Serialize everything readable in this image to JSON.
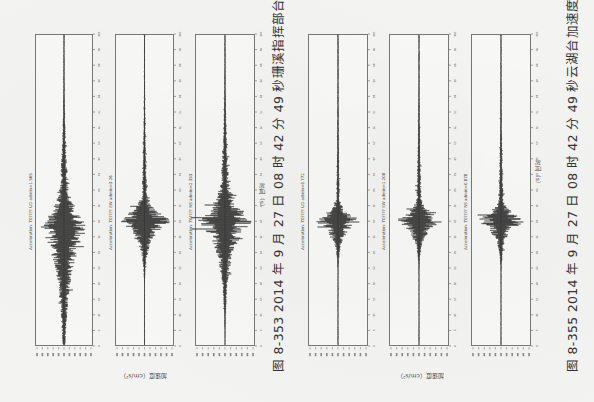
{
  "chart_data": [
    {
      "type": "line",
      "figure_number": "图 8-353",
      "title": "2014 年 9 月 27 日 08 时 42 分 49 秒珊溪指挥部台加速度记录",
      "orientation": "rotated 90° (time axis runs top-to-bottom along page)",
      "xlabel": "时间（s）",
      "ylabel": "加速度（cm/s²）",
      "grid": false,
      "series": [
        {
          "name": "Acceleration (UD component)",
          "panel_title": "Acceleration: T0???? UD admin=1.565",
          "peak_amplitude_label": "1.565",
          "envelope": {
            "onset": 0.45,
            "peak": 0.62,
            "decay": 0.78,
            "max": 0.9,
            "pre": 0.12,
            "spread": 0.14
          }
        },
        {
          "name": "Acceleration (EW component)",
          "panel_title": "Acceleration: T0???? EW admin=3.26",
          "peak_amplitude_label": "3.26",
          "envelope": {
            "onset": 0.5,
            "peak": 0.6,
            "decay": 0.72,
            "max": 1.0,
            "pre": 0.08,
            "spread": 0.05
          }
        },
        {
          "name": "Acceleration (NS component)",
          "panel_title": "Acceleration: T0???? NS admin=2.353",
          "peak_amplitude_label": "2.353",
          "envelope": {
            "onset": 0.45,
            "peak": 0.6,
            "decay": 0.76,
            "max": 1.0,
            "pre": 0.12,
            "spread": 0.09
          }
        }
      ],
      "time_ticks": [
        "0",
        "5",
        "10",
        "15",
        "20",
        "25",
        "30",
        "35",
        "40",
        "45",
        "50",
        "55",
        "60",
        "65",
        "70",
        "75",
        "80",
        "85",
        "90",
        "95",
        "100"
      ],
      "amplitude_ticks_count": 11
    },
    {
      "type": "line",
      "figure_number": "图 8-355",
      "title": "2014 年 9 月 27 日 08 时 42 分 49 秒云湖台加速度记录",
      "orientation": "rotated 90° (time axis runs top-to-bottom along page)",
      "xlabel": "时间（s）",
      "ylabel": "加速度（cm/s²）",
      "grid": false,
      "series": [
        {
          "name": "Acceleration (UD component)",
          "panel_title": "Acceleration: T0???? UD admin=0.772",
          "peak_amplitude_label": "0.772",
          "envelope": {
            "onset": 0.52,
            "peak": 0.6,
            "decay": 0.66,
            "max": 0.85,
            "pre": 0.05,
            "spread": 0.04
          }
        },
        {
          "name": "Acceleration (EW component)",
          "panel_title": "Acceleration: T0???? EW admin=1.208",
          "peak_amplitude_label": "1.208",
          "envelope": {
            "onset": 0.52,
            "peak": 0.6,
            "decay": 0.66,
            "max": 0.9,
            "pre": 0.08,
            "spread": 0.04
          }
        },
        {
          "name": "Acceleration (NS component)",
          "panel_title": "Acceleration: T0???? NS admin=0.878",
          "peak_amplitude_label": "0.878",
          "envelope": {
            "onset": 0.52,
            "peak": 0.6,
            "decay": 0.65,
            "max": 0.9,
            "pre": 0.07,
            "spread": 0.04
          }
        }
      ],
      "time_ticks": [
        "0",
        "5",
        "10",
        "15",
        "20",
        "25",
        "30",
        "35",
        "40",
        "45",
        "50",
        "55",
        "60",
        "65",
        "70",
        "75",
        "80",
        "85",
        "90",
        "95",
        "100"
      ],
      "amplitude_ticks_count": 11
    }
  ],
  "captions": {
    "fig1": "图 8-353   2014 年 9 月 27 日 08 时 42 分 49 秒珊溪指挥部台加速度记录",
    "fig2": "图 8-355   2014 年 9 月 27 日 08 时 42 分 49 秒云湖台加速度记录"
  },
  "labels": {
    "time_axis": "时间（s）",
    "amp_axis": "加速度（cm/s²）"
  },
  "colors": {
    "trace": "#1a1a1a",
    "frame": "#777777",
    "paper": "#f3f3f1"
  }
}
